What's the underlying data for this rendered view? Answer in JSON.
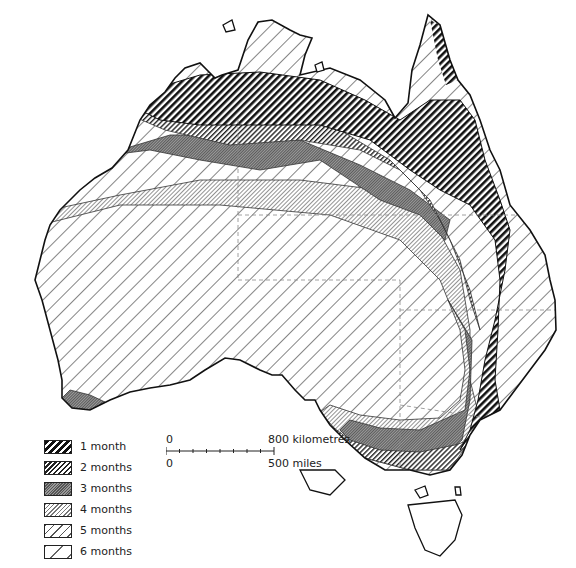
{
  "map": {
    "subject": "Australia",
    "legend": {
      "items": [
        {
          "label": "1 month",
          "pattern": "dense-heavy-hatch"
        },
        {
          "label": "2 months",
          "pattern": "dense-fine-hatch"
        },
        {
          "label": "3 months",
          "pattern": "grey-stipple-hatch"
        },
        {
          "label": "4 months",
          "pattern": "light-fine-hatch"
        },
        {
          "label": "5 months",
          "pattern": "medium-hatch"
        },
        {
          "label": "6 months",
          "pattern": "sparse-hatch"
        }
      ]
    },
    "scale_bar": {
      "km_zero": "0",
      "km_max": "800 kilometres",
      "mi_zero": "0",
      "mi_max": "500 miles"
    }
  }
}
